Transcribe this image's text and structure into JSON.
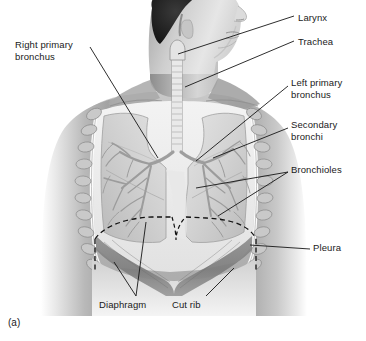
{
  "figure": {
    "caption": "(a)",
    "background_color": "#ffffff",
    "line_color": "#1a1a1a",
    "label_color": "#1a1a1a"
  },
  "labels": [
    {
      "id": "larynx",
      "text": "Larynx",
      "side": "right",
      "x": 298,
      "y": 17
    },
    {
      "id": "trachea",
      "text": "Trachea",
      "side": "right",
      "x": 298,
      "y": 42
    },
    {
      "id": "left-primary-bronchus",
      "text": "Left primary\nbronchus",
      "side": "right",
      "x": 291,
      "y": 81
    },
    {
      "id": "secondary-bronchi",
      "text": "Secondary\nbronchi",
      "side": "right",
      "x": 291,
      "y": 123
    },
    {
      "id": "bronchioles",
      "text": "Bronchioles",
      "side": "right",
      "x": 291,
      "y": 168
    },
    {
      "id": "pleura",
      "text": "Pleura",
      "side": "right",
      "x": 313,
      "y": 245
    },
    {
      "id": "right-primary-bronchus",
      "text": "Right primary\nbronchus",
      "side": "left",
      "x": 15,
      "y": 43
    },
    {
      "id": "diaphragm",
      "text": "Diaphragm",
      "side": "bottom",
      "x": 99,
      "y": 303
    },
    {
      "id": "cut-rib",
      "text": "Cut rib",
      "side": "bottom",
      "x": 172,
      "y": 303
    }
  ],
  "structures": {
    "body": "human head, neck, shoulders and upper torso, anterior view, grayscale",
    "thoracic_cavity": "opened chest showing lungs, bronchial tree and pleura",
    "trachea": "central vertical airway descending from larynx",
    "lungs": "left and right lungs with lobes, pale gray",
    "bronchial_tree": "branching primary, secondary bronchi and bronchioles",
    "ribs": "cut rib ends along lateral chest wall",
    "diaphragm": "dashed outline of diaphragm dome plus muscular sheet below"
  }
}
